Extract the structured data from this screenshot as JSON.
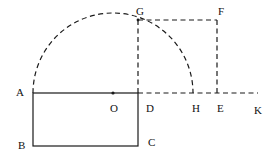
{
  "diagram": {
    "labels": {
      "A": "A",
      "B": "B",
      "C": "C",
      "D": "D",
      "E": "E",
      "F": "F",
      "G": "G",
      "H": "H",
      "K": "K",
      "O": "O"
    },
    "colors": {
      "stroke": "#1a1a1a",
      "background": "#ffffff"
    }
  }
}
